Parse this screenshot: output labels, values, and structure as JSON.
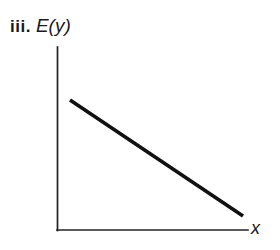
{
  "figure": {
    "index_label": "iii.",
    "y_axis_label": "E(y)",
    "x_axis_label": "x"
  },
  "chart_data": {
    "type": "line",
    "title": "iii. E(y)",
    "xlabel": "x",
    "ylabel": "E(y)",
    "grid": false,
    "legend": "none",
    "axes": {
      "x_axis_from_px": [
        57,
        230
      ],
      "x_axis_to_px": [
        248,
        230
      ],
      "y_axis_from_px": [
        57,
        47
      ],
      "y_axis_to_px": [
        57,
        230
      ]
    },
    "xlim": [
      0,
      1
    ],
    "ylim": [
      0,
      1
    ],
    "series": [
      {
        "name": "E(y)",
        "relationship": "linear decreasing",
        "x": [
          0.07,
          1.0
        ],
        "y": [
          0.71,
          0.08
        ],
        "points_px": [
          [
            70,
            100
          ],
          [
            243,
            216
          ]
        ],
        "color": "#111111"
      }
    ]
  },
  "colors": {
    "background": "#ffffff",
    "axis": "#232323",
    "line": "#111111",
    "text": "#1a1a1a"
  }
}
